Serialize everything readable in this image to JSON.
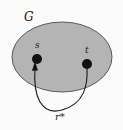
{
  "figure": {
    "type": "graph-diagram",
    "background_color": "#fbfbfb",
    "region": {
      "name": "graph-region",
      "label": "G",
      "fill_color": "#b4b4b4",
      "stroke_color": "#555555",
      "center_x": 62,
      "center_y": 57,
      "radius_x": 50,
      "radius_y": 35
    },
    "nodes": [
      {
        "id": "s",
        "label": "s",
        "x": 37,
        "y": 59,
        "radius": 5,
        "color": "#111111"
      },
      {
        "id": "t",
        "label": "t",
        "x": 87,
        "y": 64,
        "radius": 5,
        "color": "#111111"
      }
    ],
    "edges": [
      {
        "id": "r-star",
        "label": "r*",
        "from": "t",
        "to": "s",
        "directed": true,
        "arrow_at": "s",
        "stroke_color": "#1a1a1a",
        "stroke_width": 1
      }
    ]
  }
}
